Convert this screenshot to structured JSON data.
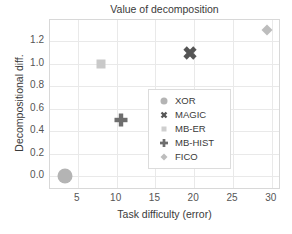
{
  "chart_data": {
    "type": "scatter",
    "title": "Value of decomposition",
    "xlabel": "Task difficulty (error)",
    "ylabel": "Decompositional diff.",
    "xlim": [
      1.4,
      31.2
    ],
    "ylim": [
      -0.12,
      1.39
    ],
    "xticks": [
      "5",
      "10",
      "15",
      "20",
      "25",
      "30"
    ],
    "xtick_values": [
      5,
      10,
      15,
      20,
      25,
      30
    ],
    "yticks": [
      "0.0",
      "0.2",
      "0.4",
      "0.6",
      "0.8",
      "1.0",
      "1.2"
    ],
    "ytick_values": [
      0.0,
      0.2,
      0.4,
      0.6,
      0.8,
      1.0,
      1.2
    ],
    "grid": true,
    "legend_position": "lower right",
    "points": [
      {
        "name": "XOR",
        "x": 3.3,
        "y": 0.0,
        "marker": "circle",
        "color": "#b4b4b4",
        "size": 15
      },
      {
        "name": "MAGIC",
        "x": 19.4,
        "y": 1.1,
        "marker": "x",
        "color": "#555555",
        "size": 14
      },
      {
        "name": "MB-ER",
        "x": 8.0,
        "y": 1.0,
        "marker": "square",
        "color": "#c9c9c9",
        "size": 9
      },
      {
        "name": "MB-HIST",
        "x": 10.6,
        "y": 0.5,
        "marker": "plus",
        "color": "#6e6e6e",
        "size": 13
      },
      {
        "name": "FICO",
        "x": 29.4,
        "y": 1.3,
        "marker": "diamond",
        "color": "#bdbdbd",
        "size": 11
      }
    ],
    "series": [
      {
        "name": "XOR",
        "values": [
          [
            3.3,
            0.0
          ]
        ]
      },
      {
        "name": "MAGIC",
        "values": [
          [
            19.4,
            1.1
          ]
        ]
      },
      {
        "name": "MB-ER",
        "values": [
          [
            8.0,
            1.0
          ]
        ]
      },
      {
        "name": "MB-HIST",
        "values": [
          [
            10.6,
            0.5
          ]
        ]
      },
      {
        "name": "FICO",
        "values": [
          [
            29.4,
            1.3
          ]
        ]
      }
    ]
  },
  "legend": {
    "entries": [
      {
        "label": "XOR",
        "marker": "circle-icon",
        "color": "#b4b4b4",
        "size": 7
      },
      {
        "label": "MAGIC",
        "marker": "x-icon",
        "color": "#555555",
        "size": 7
      },
      {
        "label": "MB-ER",
        "marker": "square-icon",
        "color": "#cfcfcf",
        "size": 5
      },
      {
        "label": "MB-HIST",
        "marker": "plus-icon",
        "color": "#6e6e6e",
        "size": 8
      },
      {
        "label": "FICO",
        "marker": "diamond-icon",
        "color": "#bdbdbd",
        "size": 7
      }
    ]
  },
  "colors": {
    "frame": "#d8d8d8",
    "grid": "#e9e9e9",
    "text": "#3a3a3a",
    "tick_text": "#555555",
    "background": "#ffffff"
  }
}
